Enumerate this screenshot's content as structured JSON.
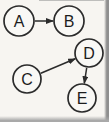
{
  "diagram": {
    "type": "directed-graph",
    "background_color": "#f7f5f1",
    "stroke_color": "#2b2b2b",
    "node_fill": "#f9f8f5",
    "label_color": "#1d1d1d",
    "edge_shadow_color": "#8f8f8f",
    "bottom_shadow_color": "#a9a9a9",
    "nodes": [
      {
        "id": "A",
        "label": "A",
        "x": 19,
        "y": 21,
        "r": 15
      },
      {
        "id": "B",
        "label": "B",
        "x": 69,
        "y": 21,
        "r": 15
      },
      {
        "id": "C",
        "label": "C",
        "x": 27,
        "y": 79,
        "r": 14
      },
      {
        "id": "D",
        "label": "D",
        "x": 89,
        "y": 53,
        "r": 14
      },
      {
        "id": "E",
        "label": "E",
        "x": 82,
        "y": 98,
        "r": 14
      }
    ],
    "edges": [
      {
        "from": "A",
        "to": "B"
      },
      {
        "from": "C",
        "to": "D"
      },
      {
        "from": "D",
        "to": "E"
      }
    ]
  }
}
